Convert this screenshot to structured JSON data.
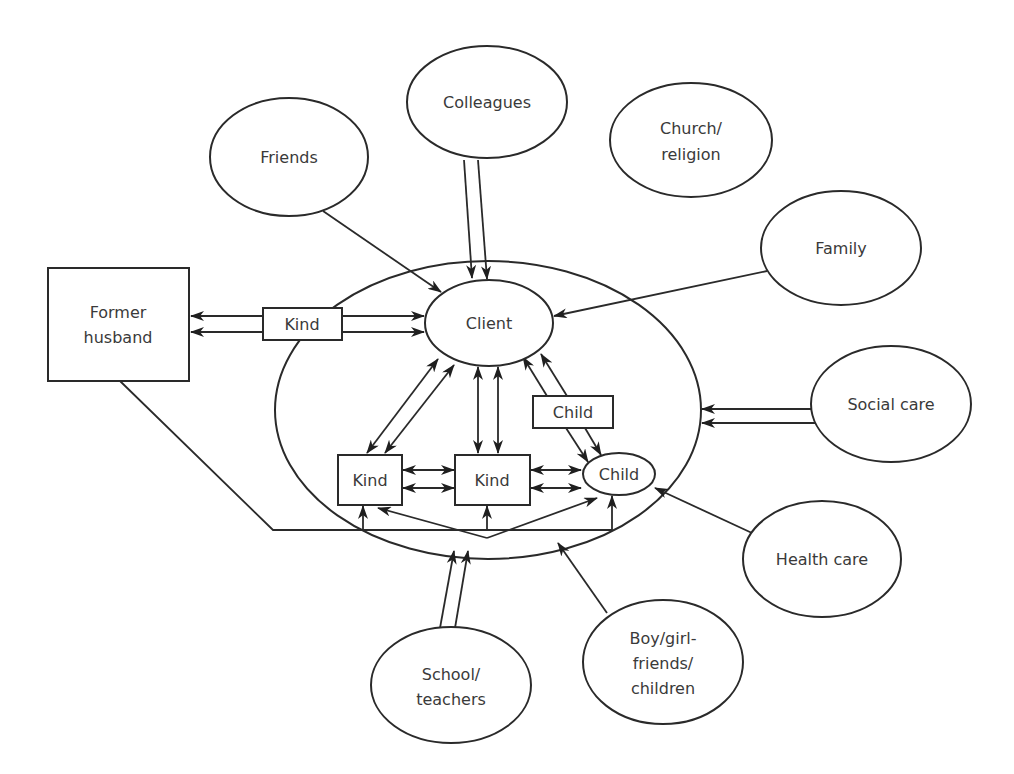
{
  "diagram": {
    "type": "ecomap",
    "nodes": {
      "colleagues": {
        "label": "Colleagues"
      },
      "friends": {
        "label": "Friends"
      },
      "church": {
        "line1": "Church/",
        "line2": "religion"
      },
      "family": {
        "label": "Family"
      },
      "former_husband": {
        "line1": "Former",
        "line2": "husband"
      },
      "kind_link": {
        "label": "Kind"
      },
      "client": {
        "label": "Client"
      },
      "child_link": {
        "label": "Child"
      },
      "kind_left": {
        "label": "Kind"
      },
      "kind_mid": {
        "label": "Kind"
      },
      "child": {
        "label": "Child"
      },
      "social_care": {
        "label": "Social care"
      },
      "health_care": {
        "label": "Health care"
      },
      "school": {
        "line1": "School/",
        "line2": "teachers"
      },
      "boy_girl": {
        "line1": "Boy/girl-",
        "line2": "friends/",
        "line3": "children"
      }
    },
    "edges": [
      {
        "from": "Colleagues",
        "to": "Client",
        "style": "double",
        "direction": "to"
      },
      {
        "from": "Friends",
        "to": "Client",
        "style": "single",
        "direction": "to"
      },
      {
        "from": "Family",
        "to": "Client",
        "style": "single",
        "direction": "to"
      },
      {
        "from": "Kind",
        "to": "Former husband",
        "style": "double",
        "direction": "to"
      },
      {
        "from": "Kind",
        "to": "Client",
        "style": "double",
        "direction": "to"
      },
      {
        "from": "Client",
        "to": "Kind (left)",
        "style": "double",
        "direction": "both"
      },
      {
        "from": "Client",
        "to": "Kind (middle)",
        "style": "double",
        "direction": "both"
      },
      {
        "from": "Child (box)",
        "to": "Client",
        "style": "double",
        "direction": "to"
      },
      {
        "from": "Child (box)",
        "to": "Child",
        "style": "double",
        "direction": "to"
      },
      {
        "from": "Kind (left)",
        "to": "Kind (middle)",
        "style": "double",
        "direction": "both"
      },
      {
        "from": "Kind (middle)",
        "to": "Child",
        "style": "double",
        "direction": "both"
      },
      {
        "from": "Former husband",
        "to": "Kind (left), Kind (middle), Child",
        "style": "single-branching",
        "direction": "to"
      },
      {
        "from": "Social care",
        "to": "Household",
        "style": "double",
        "direction": "to"
      },
      {
        "from": "Health care",
        "to": "Child",
        "style": "single",
        "direction": "to"
      },
      {
        "from": "School/teachers",
        "to": "Household",
        "style": "double",
        "direction": "to"
      },
      {
        "from": "Boy/girl-friends/children",
        "to": "Household",
        "style": "single",
        "direction": "to"
      },
      {
        "from": "Church/religion",
        "to": null,
        "style": "none",
        "direction": "none"
      }
    ]
  }
}
